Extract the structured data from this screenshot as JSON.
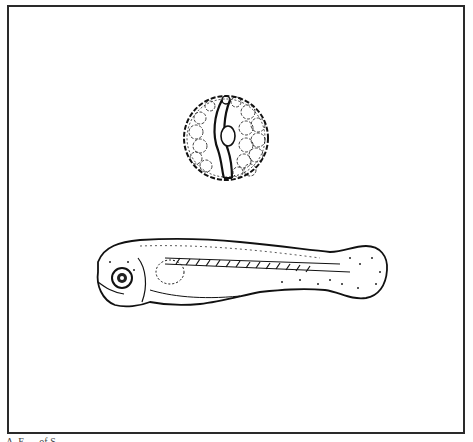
{
  "figure": {
    "frame": {
      "border_color": "#2a2a2a",
      "background": "#ffffff"
    },
    "illustrations": [
      {
        "id": "egg",
        "label": "egg-with-embryo"
      },
      {
        "id": "larva",
        "label": "fish-larva"
      }
    ],
    "caption": "A. E..... of S......"
  }
}
